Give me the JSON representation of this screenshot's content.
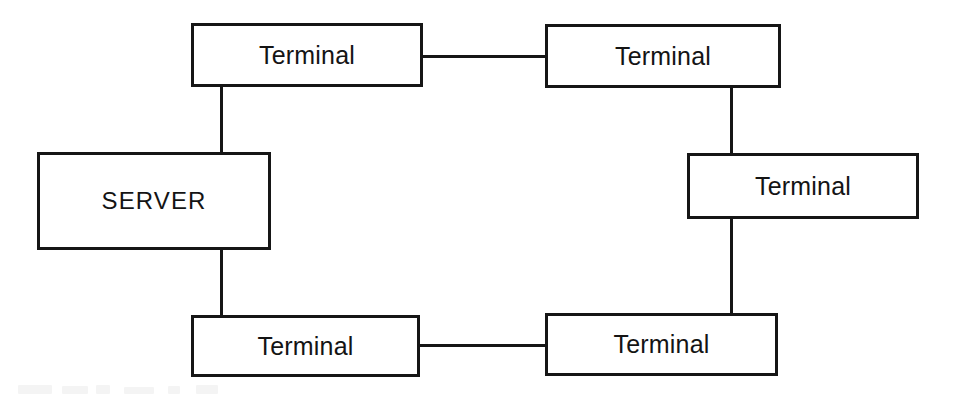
{
  "diagram": {
    "topology": "ring",
    "background_color": "#ffffff",
    "line_color": "#161616",
    "text_color": "#141414",
    "nodes": [
      {
        "id": "terminal-top-left",
        "label": "Terminal",
        "role": "terminal",
        "x": 191,
        "y": 23,
        "w": 232,
        "h": 64
      },
      {
        "id": "terminal-top-right",
        "label": "Terminal",
        "role": "terminal",
        "x": 545,
        "y": 24,
        "w": 236,
        "h": 64
      },
      {
        "id": "server",
        "label": "SERVER",
        "role": "server",
        "x": 37,
        "y": 152,
        "w": 234,
        "h": 98
      },
      {
        "id": "terminal-right-middle",
        "label": "Terminal",
        "role": "terminal",
        "x": 687,
        "y": 153,
        "w": 232,
        "h": 66
      },
      {
        "id": "terminal-bottom-left",
        "label": "Terminal",
        "role": "terminal",
        "x": 191,
        "y": 315,
        "w": 229,
        "h": 62
      },
      {
        "id": "terminal-bottom-right",
        "label": "Terminal",
        "role": "terminal",
        "x": 545,
        "y": 313,
        "w": 233,
        "h": 63
      }
    ],
    "links": [
      {
        "id": "link-top-horizontal",
        "from": "terminal-top-left",
        "to": "terminal-top-right",
        "orientation": "h",
        "x": 420,
        "y": 55,
        "length": 128
      },
      {
        "id": "link-topleft-to-server",
        "from": "terminal-top-left",
        "to": "server",
        "orientation": "v",
        "x": 220,
        "y": 85,
        "length": 70
      },
      {
        "id": "link-server-to-bottomleft",
        "from": "server",
        "to": "terminal-bottom-left",
        "orientation": "v",
        "x": 220,
        "y": 247,
        "length": 70
      },
      {
        "id": "link-bottom-horizontal",
        "from": "terminal-bottom-left",
        "to": "terminal-bottom-right",
        "orientation": "h",
        "x": 417,
        "y": 344,
        "length": 131
      },
      {
        "id": "link-topright-to-right",
        "from": "terminal-top-right",
        "to": "terminal-right-middle",
        "orientation": "v",
        "x": 730,
        "y": 86,
        "length": 70
      },
      {
        "id": "link-right-to-bottomright",
        "from": "terminal-right-middle",
        "to": "terminal-bottom-right",
        "orientation": "v",
        "x": 730,
        "y": 217,
        "length": 98
      }
    ],
    "scan_artifacts": [
      {
        "x": 18,
        "y": 385,
        "w": 34,
        "h": 9
      },
      {
        "x": 62,
        "y": 386,
        "w": 26,
        "h": 8
      },
      {
        "x": 96,
        "y": 385,
        "w": 14,
        "h": 9
      },
      {
        "x": 124,
        "y": 387,
        "w": 30,
        "h": 7
      },
      {
        "x": 168,
        "y": 386,
        "w": 12,
        "h": 8
      },
      {
        "x": 196,
        "y": 385,
        "w": 22,
        "h": 9
      }
    ]
  }
}
